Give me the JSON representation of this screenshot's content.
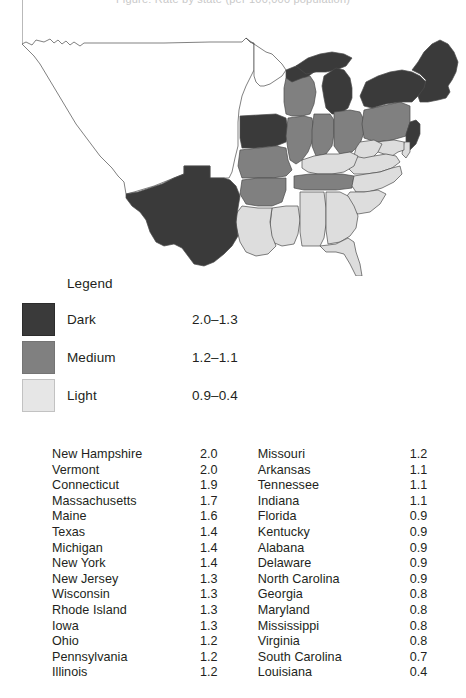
{
  "figure": {
    "title_cropped": "Figure: Rate by state (per 100,000 population)",
    "legend_heading": "Legend"
  },
  "colors": {
    "dark": "#3a3a3a",
    "medium": "#808080",
    "light": "#dddddd",
    "unshaded": "#ffffff",
    "outline": "#4a4a4a",
    "text": "#231f20"
  },
  "legend": {
    "items": [
      {
        "label": "Dark",
        "range": "2.0–1.3",
        "color_key": "dark"
      },
      {
        "label": "Medium",
        "range": "1.2–1.1",
        "color_key": "medium"
      },
      {
        "label": "Light",
        "range": "0.9–0.4",
        "color_key": "light"
      }
    ]
  },
  "chart_data": {
    "type": "map",
    "title": "Figure: Rate by state (per 100,000 population)",
    "legend_position": "below-map",
    "classes": [
      {
        "name": "Dark",
        "range": [
          2.0,
          1.3
        ],
        "range_label": "2.0–1.3",
        "color": "#3a3a3a"
      },
      {
        "name": "Medium",
        "range": [
          1.2,
          1.1
        ],
        "range_label": "1.2–1.1",
        "color": "#808080"
      },
      {
        "name": "Light",
        "range": [
          0.9,
          0.4
        ],
        "range_label": "0.9–0.4",
        "color": "#dddddd"
      }
    ],
    "value_range": [
      0.4,
      2.0
    ],
    "categories": [
      "New Hampshire",
      "Vermont",
      "Connecticut",
      "Massachusetts",
      "Maine",
      "Texas",
      "Michigan",
      "New York",
      "New Jersey",
      "Wisconsin",
      "Rhode Island",
      "Iowa",
      "Ohio",
      "Pennsylvania",
      "Illinois",
      "Missouri",
      "Arkansas",
      "Tennessee",
      "Indiana",
      "Florida",
      "Kentucky",
      "Alabana",
      "Delaware",
      "North Carolina",
      "Georgia",
      "Maryland",
      "Mississippi",
      "Virginia",
      "South Carolina",
      "Louisiana"
    ],
    "values": [
      2.0,
      2.0,
      1.9,
      1.7,
      1.6,
      1.4,
      1.4,
      1.4,
      1.3,
      1.3,
      1.3,
      1.3,
      1.2,
      1.2,
      1.2,
      1.2,
      1.1,
      1.1,
      1.1,
      0.9,
      0.9,
      0.9,
      0.9,
      0.9,
      0.8,
      0.8,
      0.8,
      0.8,
      0.7,
      0.4
    ]
  },
  "table": {
    "left": [
      {
        "state": "New Hampshire",
        "value": "2.0"
      },
      {
        "state": "Vermont",
        "value": "2.0"
      },
      {
        "state": "Connecticut",
        "value": "1.9"
      },
      {
        "state": "Massachusetts",
        "value": "1.7"
      },
      {
        "state": "Maine",
        "value": "1.6"
      },
      {
        "state": "Texas",
        "value": "1.4"
      },
      {
        "state": "Michigan",
        "value": "1.4"
      },
      {
        "state": "New York",
        "value": "1.4"
      },
      {
        "state": "New Jersey",
        "value": "1.3"
      },
      {
        "state": "Wisconsin",
        "value": "1.3"
      },
      {
        "state": "Rhode Island",
        "value": "1.3"
      },
      {
        "state": "Iowa",
        "value": "1.3"
      },
      {
        "state": "Ohio",
        "value": "1.2"
      },
      {
        "state": "Pennsylvania",
        "value": "1.2"
      },
      {
        "state": "Illinois",
        "value": "1.2"
      }
    ],
    "right": [
      {
        "state": "Missouri",
        "value": "1.2"
      },
      {
        "state": "Arkansas",
        "value": "1.1"
      },
      {
        "state": "Tennessee",
        "value": "1.1"
      },
      {
        "state": "Indiana",
        "value": "1.1"
      },
      {
        "state": "Florida",
        "value": "0.9"
      },
      {
        "state": "Kentucky",
        "value": "0.9"
      },
      {
        "state": "Alabana",
        "value": "0.9"
      },
      {
        "state": "Delaware",
        "value": "0.9"
      },
      {
        "state": "North Carolina",
        "value": "0.9"
      },
      {
        "state": "Georgia",
        "value": "0.8"
      },
      {
        "state": "Maryland",
        "value": "0.8"
      },
      {
        "state": "Mississippi",
        "value": "0.8"
      },
      {
        "state": "Virginia",
        "value": "0.8"
      },
      {
        "state": "South Carolina",
        "value": "0.7"
      },
      {
        "state": "Louisiana",
        "value": "0.4"
      }
    ]
  },
  "map": {
    "shading": {
      "ME": "dark",
      "NH": "dark",
      "VT": "dark",
      "MA": "dark",
      "RI": "dark",
      "CT": "dark",
      "NY": "dark",
      "NJ": "dark",
      "MI": "dark",
      "WI_N": "dark",
      "IA": "dark",
      "TX": "dark",
      "MN": "unshaded",
      "WI": "medium",
      "IL": "medium",
      "IN": "medium",
      "OH": "medium",
      "PA": "medium",
      "MO": "medium",
      "AR": "medium",
      "TN": "medium",
      "KY": "light",
      "WV": "light",
      "VA": "light",
      "MD": "light",
      "DE": "light",
      "NC": "light",
      "SC": "light",
      "GA": "light",
      "FL": "light",
      "AL": "light",
      "MS": "light",
      "LA": "light",
      "WEST": "unshaded"
    }
  }
}
